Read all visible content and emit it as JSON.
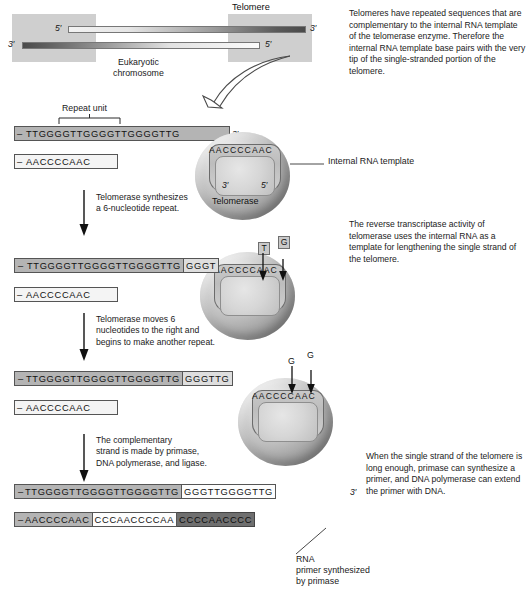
{
  "chromosome": {
    "telomere_label": "Telomere",
    "name_label": "Eukaryotic\nchromosome",
    "top_left_prime": "5′",
    "top_right_prime": "3′",
    "bottom_left_prime": "3′",
    "bottom_right_prime": "5′"
  },
  "annotations": {
    "repeat_unit": "Repeat unit",
    "internal_rna_template": "Internal RNA template",
    "telomerase": "Telomerase",
    "rna_primer": "RNA\nprimer synthesized\nby primase"
  },
  "side_texts": [
    "Telomeres have repeated sequences that are complementary to the internal RNA template of the telomerase enzyme. Therefore the internal RNA template base pairs with the very tip of the single-stranded portion of the telomere.",
    "The reverse transcriptase activity of telomerase uses the internal RNA as a template for lengthening the single strand of the telomere.",
    "When the single strand of the telomere is long enough, primase can synthesize a primer, and DNA polymerase can extend the primer with DNA."
  ],
  "step_arrows": [
    "Telomerase synthesizes\na 6-nucleotide repeat.",
    "Telomerase moves 6\nnucleotides to the right and\nbegins to make another repeat.",
    "The complementary\nstrand is made by primase,\nDNA polymerase, and ligase."
  ],
  "stages": [
    {
      "id": "stage-1",
      "top_strand": {
        "dash": "–",
        "segments": [
          {
            "text": "TTGGGGTTGGGGTTGGGGTTG",
            "tone": "mid"
          }
        ],
        "end_prime": "3′"
      },
      "bottom_strand": {
        "dash": "–",
        "segments": [
          {
            "text": "AACCCCAAC",
            "tone": "pale"
          }
        ]
      },
      "rna_template": "AACCCCAAC",
      "rna_prime_left": "3′",
      "rna_prime_right": "5′",
      "incoming_nucleotides": []
    },
    {
      "id": "stage-2",
      "top_strand": {
        "dash": "–",
        "segments": [
          {
            "text": "TTGGGGTTGGGGTTGGGGTTG",
            "tone": "mid"
          },
          {
            "text": "GGGT",
            "tone": "light"
          }
        ],
        "end_prime": ""
      },
      "bottom_strand": {
        "dash": "–",
        "segments": [
          {
            "text": "AACCCCAAC",
            "tone": "pale"
          }
        ]
      },
      "rna_template": "AACCCCAAC",
      "incoming_nucleotides": [
        "T",
        "G"
      ]
    },
    {
      "id": "stage-3",
      "top_strand": {
        "dash": "–",
        "segments": [
          {
            "text": "TTGGGGTTGGGGTTGGGGTTG",
            "tone": "mid"
          },
          {
            "text": "GGGTTG",
            "tone": "light"
          }
        ],
        "end_prime": ""
      },
      "bottom_strand": {
        "dash": "–",
        "segments": [
          {
            "text": "AACCCCAAC",
            "tone": "pale"
          }
        ]
      },
      "rna_template": "AACCCCAAC",
      "incoming_nucleotides": [
        "G",
        "G"
      ]
    },
    {
      "id": "stage-4",
      "top_strand": {
        "dash": "–",
        "segments": [
          {
            "text": "TTGGGGTTGGGGTTGGGGTTG",
            "tone": "mid"
          },
          {
            "text": "GGGTTGGGGTTG",
            "tone": "white"
          }
        ],
        "end_prime": "3′"
      },
      "bottom_strand": {
        "dash": "–",
        "segments": [
          {
            "text": "AACCCCAAC",
            "tone": "mid"
          },
          {
            "text": "CCCAACCCCAA",
            "tone": "white"
          },
          {
            "text": "CCCCAACCCC",
            "tone": "vdark"
          }
        ]
      },
      "incoming_nucleotides": []
    }
  ]
}
